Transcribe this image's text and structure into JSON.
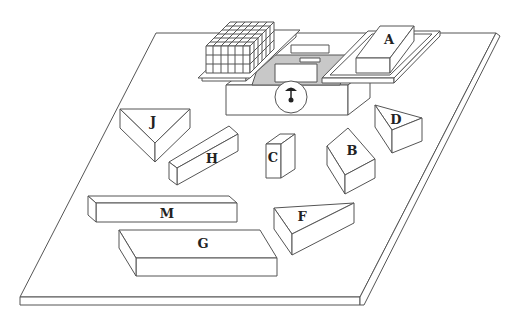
{
  "diagram": {
    "type": "isometric puzzle board with balance scale",
    "colors": {
      "line": "#555555",
      "fill": "#ffffff",
      "shadow_gray": "#c8c8c8",
      "label": "#222222"
    },
    "scale": {
      "left_pan_content": "stack of unit cubes",
      "right_pan_block": "A",
      "dial_icon": "needle-dial"
    },
    "blocks": [
      {
        "id": "A",
        "label": "A",
        "shape": "rectangular prism",
        "location": "right pan of scale"
      },
      {
        "id": "B",
        "label": "B",
        "shape": "square prism",
        "location": "center-right"
      },
      {
        "id": "C",
        "label": "C",
        "shape": "tall rectangular prism",
        "location": "center"
      },
      {
        "id": "D",
        "label": "D",
        "shape": "triangular prism",
        "location": "right"
      },
      {
        "id": "F",
        "label": "F",
        "shape": "triangular prism",
        "location": "lower right"
      },
      {
        "id": "G",
        "label": "G",
        "shape": "long rectangular prism",
        "location": "center-left"
      },
      {
        "id": "H",
        "label": "H",
        "shape": "triangular prism",
        "location": "upper left"
      },
      {
        "id": "J",
        "label": "J",
        "shape": "long flat rectangular prism",
        "location": "lower left"
      },
      {
        "id": "M",
        "label": "M",
        "shape": "large flat rectangular prism",
        "location": "bottom"
      }
    ]
  }
}
